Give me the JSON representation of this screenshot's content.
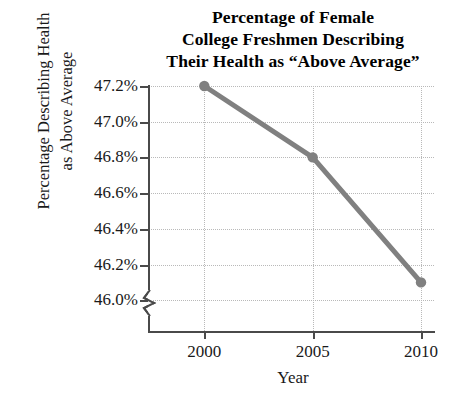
{
  "chart_data": {
    "type": "line",
    "title": "Percentage of Female College Freshmen Describing Their Health as “Above Average”",
    "title_lines": [
      "Percentage of Female",
      "College Freshmen Describing",
      "Their Health as “Above Average”"
    ],
    "xlabel": "Year",
    "ylabel": "Percentage Describing Health as Above Average",
    "ylabel_lines": [
      "Percentage Describing Health",
      "as Above Average"
    ],
    "x": [
      2000,
      2005,
      2010
    ],
    "values": [
      47.2,
      46.8,
      46.1
    ],
    "point_labels": [
      "47.2%",
      "46.8%",
      "46.1%"
    ],
    "series": [
      {
        "name": "Percentage Describing Health as Above Average",
        "values": [
          47.2,
          46.8,
          46.1
        ]
      }
    ],
    "xlim": [
      1997.4,
      2010.6
    ],
    "ylim": [
      45.9,
      47.2
    ],
    "xticks": [
      2000,
      2005,
      2010
    ],
    "xtick_labels": [
      "2000",
      "2005",
      "2010"
    ],
    "yticks": [
      46.0,
      46.2,
      46.4,
      46.6,
      46.8,
      47.0,
      47.2
    ],
    "ytick_labels": [
      "46.0%",
      "46.2%",
      "46.4%",
      "46.6%",
      "47.0%",
      "47.2%"
    ],
    "ytick_labels_full": [
      "47.2%",
      "47.0%",
      "46.8%",
      "46.6%",
      "46.4%",
      "46.2%",
      "46.0%"
    ],
    "grid": true,
    "grid_style": "dotted",
    "legend": "none",
    "y_axis_break": true,
    "line_color": "#808080",
    "marker_color": "#808080",
    "axis_color": "#4a4a4a",
    "grid_color": "#b9b9b9",
    "background": "#ffffff",
    "marker": "circle",
    "line_width": 5
  }
}
